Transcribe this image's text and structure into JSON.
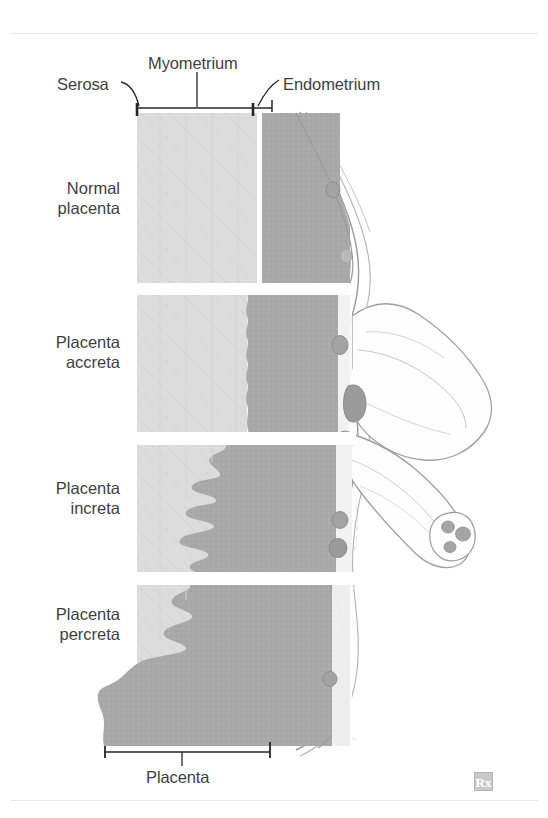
{
  "figure": {
    "domain": "medical-illustration"
  },
  "callouts": {
    "serosa": "Serosa",
    "myometrium": "Myometrium",
    "endometrium": "Endometrium",
    "placenta": "Placenta"
  },
  "rows": [
    {
      "id": "normal",
      "line1": "Normal",
      "line2": "placenta"
    },
    {
      "id": "accreta",
      "line1": "Placenta",
      "line2": "accreta"
    },
    {
      "id": "increta",
      "line1": "Placenta",
      "line2": "increta"
    },
    {
      "id": "percreta",
      "line1": "Placenta",
      "line2": "percreta"
    }
  ],
  "watermark": {
    "label": "Rx"
  },
  "colors": {
    "myometrium": "#d9d9d9",
    "myometrium_light": "#e2e2e2",
    "placenta": "#a9a9a9",
    "endometrium": "#ffffff",
    "vessel": "#9d9d9d",
    "outline": "#8f8f8f",
    "serosa_line": "#262626",
    "text": "#403f3f",
    "rule": "#e9e9ea",
    "background": "#ffffff"
  }
}
